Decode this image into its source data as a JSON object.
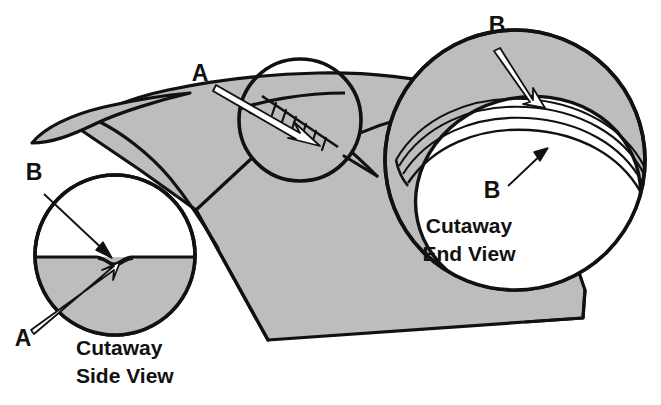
{
  "figure": {
    "type": "technical-illustration",
    "background_color": "#ffffff",
    "fill_color": "#bdbdbd",
    "line_color": "#111111"
  },
  "callouts": {
    "a_top": {
      "label": "A",
      "x": 200,
      "y": 81,
      "arrow": "white-filled arrow pointing down-right into middle detail circle"
    },
    "a_side": {
      "label": "A",
      "x": 23,
      "y": 346,
      "arrow": "white-filled arrow pointing up-right to the notch"
    },
    "b_side": {
      "label": "B",
      "x": 34,
      "y": 180,
      "arrow": "thin black arrow pointing down-right to the split line"
    },
    "b_end_outer": {
      "label": "B",
      "x": 497,
      "y": 33,
      "arrow": "white-filled arrow pointing down-right to the outer layer"
    },
    "b_end_inner": {
      "label": "B",
      "x": 492,
      "y": 198,
      "arrow": "thin black arrow pointing up-right to the layered arcs"
    }
  },
  "views": {
    "side": {
      "caption_line1": "Cutaway",
      "caption_line2": "Side View",
      "caption_x": 76,
      "caption_y1": 355,
      "caption_y2": 383,
      "circle": {
        "cx": 115,
        "cy": 255,
        "r": 80
      },
      "description": "white upper half, gray lower half, horizontal split with a small central notch"
    },
    "end": {
      "caption_line1": "Cutaway",
      "caption_line2": "End View",
      "caption_x": 469,
      "caption_y1": 233,
      "caption_y2": 261,
      "circle": {
        "cx": 515,
        "cy": 160,
        "r": 130
      },
      "description": "gray disc with offset white interior and several thin layered arcs"
    },
    "middle_detail": {
      "circle": {
        "cx": 300,
        "cy": 120,
        "r": 61
      },
      "description": "magnified area showing a cut line with hatch tick marks and dashes"
    }
  },
  "main_body": {
    "description": "large gray sheet with a curled left tip, folded front face and rolled right end"
  }
}
